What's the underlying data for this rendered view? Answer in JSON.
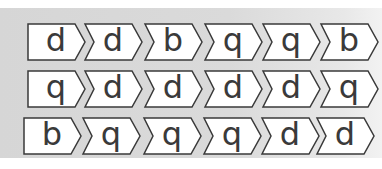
{
  "worksheet": {
    "colors": {
      "panel": "#d8d8d8",
      "tile_fill": "#ffffff",
      "tile_stroke": "#3a3a3a",
      "letter": "#3a3a3a"
    },
    "rows": [
      {
        "letters": [
          "d",
          "d",
          "b",
          "q",
          "q",
          "b"
        ]
      },
      {
        "letters": [
          "q",
          "d",
          "d",
          "d",
          "d",
          "q"
        ]
      },
      {
        "letters": [
          "b",
          "q",
          "q",
          "q",
          "d",
          "d"
        ]
      }
    ]
  }
}
